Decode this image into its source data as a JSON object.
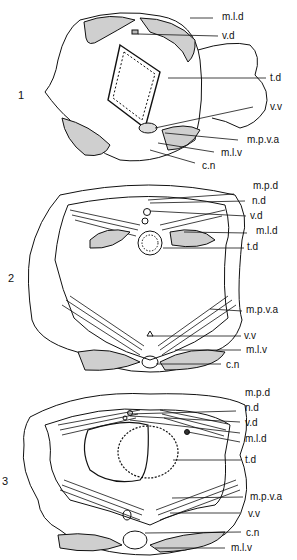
{
  "figure": {
    "panels": [
      {
        "number": "1",
        "labels": [
          "m.l.d",
          "v.d",
          "t.d",
          "v.v",
          "m.p.v.a",
          "m.l.v",
          "c.n"
        ]
      },
      {
        "number": "2",
        "labels": [
          "m.p.d",
          "n.d",
          "v.d",
          "m.l.d",
          "t.d",
          "m.p.v.a",
          "v.v",
          "m.l.v",
          "c.n"
        ]
      },
      {
        "number": "3",
        "labels": [
          "m.p.d",
          "n.d",
          "v.d",
          "m.l.d",
          "t.d",
          "m.p.v.a",
          "v.v",
          "c.n",
          "m.l.v"
        ]
      }
    ]
  }
}
